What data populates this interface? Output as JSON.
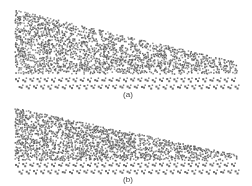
{
  "figure": {
    "background": "#ffffff",
    "particle_color": "#555555",
    "panels": [
      {
        "id": "a",
        "caption": "(a)",
        "top": 0,
        "height": 100,
        "caption_x": 113,
        "caption_y": 91,
        "pile": {
          "left_x": 15,
          "right_x": 236,
          "top_left_y": 10,
          "top_right_y": 62,
          "bottom_y": 73,
          "density": 0.55,
          "tail_bumps": [
            [
              160,
              52
            ],
            [
              205,
              60
            ]
          ]
        },
        "bed": {
          "y1": 78,
          "y2": 85,
          "x1": 15,
          "x2": 236,
          "spacing": 7.2
        },
        "seed": 7
      },
      {
        "id": "b",
        "caption": "(b)",
        "top": 100,
        "height": 86,
        "caption_x": 113,
        "caption_y": 76,
        "pile": {
          "left_x": 15,
          "right_x": 237,
          "top_left_y": 8,
          "top_right_y": 55,
          "bottom_y": 60,
          "density": 0.6,
          "tail_bumps": []
        },
        "bed": {
          "y1": 63,
          "y2": 70,
          "x1": 15,
          "x2": 237,
          "spacing": 7.2
        },
        "seed": 19
      }
    ]
  }
}
